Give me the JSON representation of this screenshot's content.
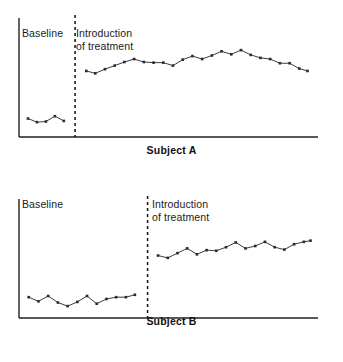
{
  "figure": {
    "title": "",
    "background_color": "#ffffff",
    "line_color": "#3b3b44",
    "marker_color": "#2a2a33",
    "axis_color": "#222222",
    "divider_color": "#111111"
  },
  "panels": [
    {
      "id": "subject-a",
      "caption": "Subject A",
      "baseline_label": "Baseline",
      "treatment_label": "Introduction\nof treatment"
    },
    {
      "id": "subject-b",
      "caption": "Subject B",
      "baseline_label": "Baseline",
      "treatment_label": "Introduction\nof treatment"
    }
  ],
  "chart_data": [
    {
      "type": "line",
      "title": "Subject A",
      "xlabel": "",
      "ylabel": "",
      "xlim": [
        0,
        40
      ],
      "ylim": [
        0,
        10
      ],
      "grid": false,
      "legend": "none",
      "annotations": [
        {
          "text": "Baseline",
          "phase": "baseline"
        },
        {
          "text": "Introduction of treatment",
          "phase": "treatment"
        }
      ],
      "phase_divider_x": 7.5,
      "series": [
        {
          "name": "baseline",
          "x": [
            1.2,
            2.4,
            3.6,
            4.8,
            6.0
          ],
          "y": [
            1.55,
            1.25,
            1.3,
            1.75,
            1.35
          ]
        },
        {
          "name": "treatment",
          "x": [
            9.0,
            10.2,
            11.5,
            12.8,
            14.1,
            15.4,
            16.7,
            18.0,
            19.3,
            20.6,
            21.9,
            23.2,
            24.5,
            25.8,
            27.1,
            28.4,
            29.7,
            31.0,
            32.3,
            33.6,
            34.9,
            36.2,
            37.5,
            38.6
          ],
          "y": [
            5.55,
            5.35,
            5.7,
            6.0,
            6.3,
            6.55,
            6.3,
            6.25,
            6.25,
            6.0,
            6.5,
            6.8,
            6.55,
            6.85,
            7.2,
            6.95,
            7.3,
            6.9,
            6.65,
            6.55,
            6.2,
            6.2,
            5.75,
            5.55
          ]
        }
      ]
    },
    {
      "type": "line",
      "title": "Subject B",
      "xlabel": "",
      "ylabel": "",
      "xlim": [
        0,
        40
      ],
      "ylim": [
        0,
        10
      ],
      "grid": false,
      "legend": "none",
      "annotations": [
        {
          "text": "Baseline",
          "phase": "baseline"
        },
        {
          "text": "Introduction of treatment",
          "phase": "treatment"
        }
      ],
      "phase_divider_x": 17.2,
      "series": [
        {
          "name": "baseline",
          "x": [
            1.3,
            2.6,
            3.9,
            5.2,
            6.5,
            7.8,
            9.1,
            10.4,
            11.7,
            13.0,
            14.3,
            15.5
          ],
          "y": [
            1.75,
            1.4,
            1.85,
            1.3,
            1.0,
            1.35,
            1.85,
            1.2,
            1.6,
            1.75,
            1.75,
            1.95
          ]
        },
        {
          "name": "treatment",
          "x": [
            18.6,
            19.9,
            21.2,
            22.5,
            23.8,
            25.1,
            26.4,
            27.7,
            29.0,
            30.3,
            31.6,
            32.9,
            34.2,
            35.5,
            36.8,
            38.1,
            39.0
          ],
          "y": [
            5.25,
            5.05,
            5.45,
            5.85,
            5.35,
            5.7,
            5.65,
            5.95,
            6.35,
            5.85,
            6.05,
            6.4,
            5.95,
            5.75,
            6.2,
            6.4,
            6.5
          ]
        }
      ]
    }
  ]
}
